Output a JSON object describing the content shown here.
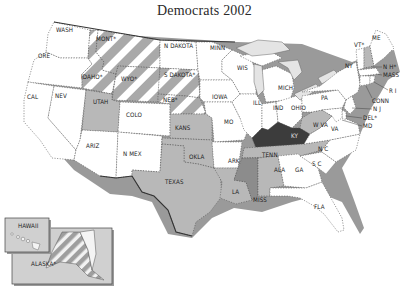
{
  "title": "Democrats 2002",
  "legend_fills": {
    "none": "#ffffff",
    "light": "#b8b8b8",
    "medium": "#8c8c8c",
    "dark": "#3c3c3c",
    "hatch_a": "#a9a9a9",
    "hatch_b": "#ffffff"
  },
  "states": {
    "wash": {
      "label": "WASH",
      "fill": "none"
    },
    "ore": {
      "label": "ORE",
      "fill": "none"
    },
    "cal": {
      "label": "CAL",
      "fill": "none"
    },
    "nev": {
      "label": "NEV",
      "fill": "none"
    },
    "idaho": {
      "label": "IDAHO*",
      "fill": "hatch"
    },
    "mont": {
      "label": "MONT*",
      "fill": "hatch"
    },
    "wyo": {
      "label": "WYO*",
      "fill": "hatch"
    },
    "utah": {
      "label": "UTAH",
      "fill": "light"
    },
    "ariz": {
      "label": "ARIZ",
      "fill": "none"
    },
    "colo": {
      "label": "COLO",
      "fill": "none"
    },
    "nmex": {
      "label": "N MEX",
      "fill": "none"
    },
    "ndakota": {
      "label": "N DAKOTA",
      "fill": "none"
    },
    "sdakota": {
      "label": "S DAKOTA*",
      "fill": "hatch"
    },
    "neb": {
      "label": "NEB*",
      "fill": "hatch"
    },
    "kans": {
      "label": "KANS",
      "fill": "light"
    },
    "okla": {
      "label": "OKLA",
      "fill": "light"
    },
    "texas": {
      "label": "TEXAS",
      "fill": "light"
    },
    "minn": {
      "label": "MINN",
      "fill": "none"
    },
    "iowa": {
      "label": "IOWA",
      "fill": "none"
    },
    "mo": {
      "label": "MO",
      "fill": "none"
    },
    "ark": {
      "label": "ARK",
      "fill": "none"
    },
    "la": {
      "label": "LA",
      "fill": "light"
    },
    "wis": {
      "label": "WIS",
      "fill": "none"
    },
    "ill": {
      "label": "ILL",
      "fill": "none"
    },
    "mich": {
      "label": "MICH",
      "fill": "none"
    },
    "ind": {
      "label": "IND",
      "fill": "none"
    },
    "ohio": {
      "label": "OHIO",
      "fill": "none"
    },
    "ky": {
      "label": "KY",
      "fill": "dark"
    },
    "tenn": {
      "label": "TENN",
      "fill": "light"
    },
    "miss": {
      "label": "MISS",
      "fill": "medium"
    },
    "ala": {
      "label": "ALA",
      "fill": "light"
    },
    "ga": {
      "label": "GA",
      "fill": "none"
    },
    "fla": {
      "label": "FLA",
      "fill": "none"
    },
    "sc": {
      "label": "S C",
      "fill": "none"
    },
    "nc": {
      "label": "N C",
      "fill": "none"
    },
    "va": {
      "label": "VA",
      "fill": "none"
    },
    "wva": {
      "label": "W VA",
      "fill": "light"
    },
    "pa": {
      "label": "PA",
      "fill": "none"
    },
    "ny": {
      "label": "NY",
      "fill": "none"
    },
    "vt": {
      "label": "VT*",
      "fill": "none"
    },
    "me": {
      "label": "ME",
      "fill": "none"
    },
    "nh": {
      "label": "N H*",
      "fill": "light"
    },
    "mass": {
      "label": "MASS",
      "fill": "none"
    },
    "ri": {
      "label": "R I",
      "fill": "none"
    },
    "conn": {
      "label": "CONN",
      "fill": "none"
    },
    "nj": {
      "label": "N J",
      "fill": "none"
    },
    "del": {
      "label": "DEL*",
      "fill": "none"
    },
    "md": {
      "label": "MD",
      "fill": "none"
    },
    "hawaii": {
      "label": "HAWAII",
      "fill": "none"
    },
    "alaska": {
      "label": "ALASKA*",
      "fill": "hatch"
    }
  }
}
